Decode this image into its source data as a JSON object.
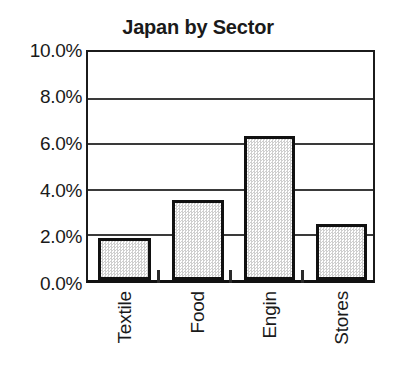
{
  "chart_data": {
    "type": "bar",
    "title": "Japan by Sector",
    "xlabel": "",
    "ylabel": "",
    "categories": [
      "Textile",
      "Food",
      "Engin",
      "Stores"
    ],
    "values": [
      1.85,
      3.5,
      6.3,
      2.45
    ],
    "value_labels": [
      "1.85%",
      "3.5%",
      "6.3%",
      "2.45%"
    ],
    "ylim": [
      0,
      10
    ],
    "ytick_labels": [
      "0.0%",
      "2.0%",
      "4.0%",
      "6.0%",
      "8.0%",
      "10.0%"
    ],
    "ytick_values": [
      0,
      2,
      4,
      6,
      8,
      10
    ],
    "grid": true,
    "grid_axis": "y",
    "legend": false,
    "legend_position": "none",
    "series": [
      {
        "name": "Japan by Sector",
        "values": [
          1.85,
          3.5,
          6.3,
          2.45
        ]
      }
    ],
    "colors": {
      "bar_fill": "#d9d9d9",
      "bar_edge": "#111111",
      "axis": "#1b1b1b",
      "grid": "#3a3a3a",
      "text": "#1a1a1a",
      "background": "#ffffff"
    }
  }
}
